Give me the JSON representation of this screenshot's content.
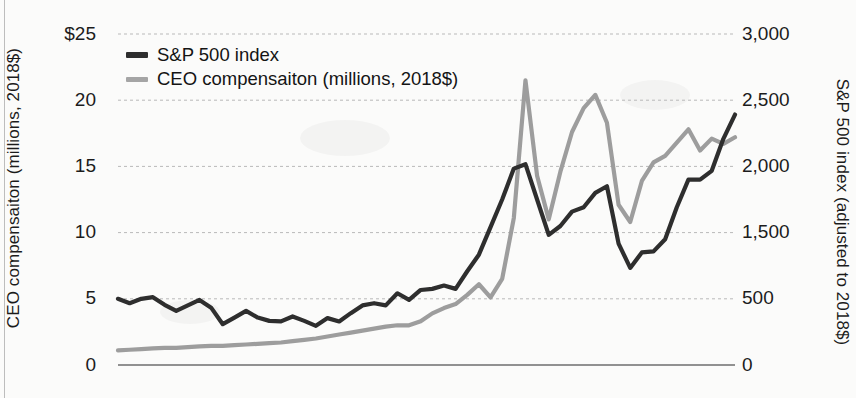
{
  "figure": {
    "background_color": "#fbfbfa",
    "left_axis_title": "CEO compensaiton (millions, 2018$)",
    "right_axis_title": "S&P 500 index (adjusted to 2018$)"
  },
  "legend": {
    "position": "top-left-inside",
    "entries": [
      {
        "label": "S&P 500 index",
        "color": "#2e2e2e",
        "swatch": "line-swatch-dark"
      },
      {
        "label": "CEO compensaiton (millions, 2018$)",
        "color": "#9d9d9d",
        "swatch": "line-swatch-gray"
      }
    ]
  },
  "axes": {
    "left_ticks": [
      "$25",
      "20",
      "15",
      "10",
      "5",
      "0"
    ],
    "left_tick_values": [
      25,
      20,
      15,
      10,
      5,
      0
    ],
    "right_ticks": [
      "3,000",
      "2,500",
      "2,000",
      "1,500",
      "500",
      "0"
    ],
    "right_tick_values": [
      3000,
      2500,
      2000,
      1500,
      500,
      0
    ],
    "left_range": [
      0,
      25
    ],
    "right_range": [
      0,
      3000
    ],
    "grid": "horizontal-dashed",
    "baseline_solid": true
  },
  "chart_data": {
    "type": "line",
    "title": "",
    "subtitle": "",
    "xlabel": "",
    "ylabel": "CEO compensaiton (millions, 2018$)",
    "y2label": "S&P 500 index (adjusted to 2018$)",
    "ylim": [
      0,
      25
    ],
    "y2lim": [
      0,
      3000
    ],
    "grid": true,
    "legend_position": "top-left",
    "x": [
      1965,
      1966,
      1967,
      1968,
      1969,
      1970,
      1971,
      1972,
      1973,
      1974,
      1975,
      1976,
      1977,
      1978,
      1979,
      1980,
      1981,
      1982,
      1983,
      1984,
      1985,
      1986,
      1987,
      1988,
      1989,
      1990,
      1991,
      1992,
      1993,
      1994,
      1995,
      1996,
      1997,
      1998,
      1999,
      2000,
      2001,
      2002,
      2003,
      2004,
      2005,
      2006,
      2007,
      2008,
      2009,
      2010,
      2011,
      2012,
      2013,
      2014,
      2015,
      2016,
      2017,
      2018
    ],
    "series": [
      {
        "name": "S&P 500 index",
        "axis": "right",
        "color": "#2e2e2e",
        "units": "index (adjusted to 2018$)",
        "values": [
          600,
          560,
          600,
          615,
          545,
          490,
          540,
          590,
          520,
          370,
          430,
          490,
          430,
          400,
          395,
          440,
          400,
          355,
          425,
          395,
          470,
          540,
          560,
          540,
          650,
          590,
          680,
          690,
          720,
          690,
          850,
          1000,
          1250,
          1500,
          1780,
          1820,
          1500,
          1180,
          1260,
          1390,
          1430,
          1560,
          1620,
          1100,
          880,
          1020,
          1030,
          1140,
          1430,
          1680,
          1680,
          1760,
          2050,
          2270
        ]
      },
      {
        "name": "CEO compensaiton (millions, 2018$)",
        "axis": "left",
        "color": "#9d9d9d",
        "units": "millions of 2018 dollars",
        "values": [
          1.1,
          1.15,
          1.2,
          1.25,
          1.3,
          1.3,
          1.35,
          1.4,
          1.45,
          1.45,
          1.5,
          1.55,
          1.6,
          1.65,
          1.7,
          1.8,
          1.9,
          2.0,
          2.15,
          2.3,
          2.45,
          2.6,
          2.75,
          2.9,
          3.0,
          3.0,
          3.3,
          3.9,
          4.3,
          4.6,
          5.3,
          6.1,
          5.1,
          6.5,
          11.1,
          21.5,
          14.3,
          11.0,
          14.6,
          17.6,
          19.4,
          20.4,
          18.3,
          12.1,
          10.8,
          13.9,
          15.3,
          15.8,
          16.8,
          17.8,
          16.2,
          17.1,
          16.7,
          17.2
        ]
      }
    ]
  }
}
